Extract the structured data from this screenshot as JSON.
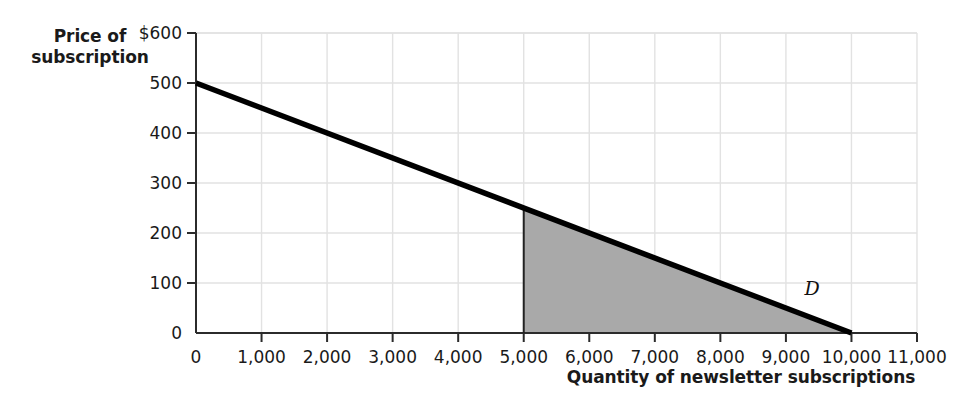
{
  "chart_data": {
    "type": "line",
    "title": "",
    "xlabel": "Quantity of newsletter subscriptions",
    "ylabel": "Price of subscription",
    "ylabel_line1": "Price of",
    "ylabel_line2": "subscription",
    "xlim": [
      0,
      11000
    ],
    "ylim": [
      0,
      600
    ],
    "grid": true,
    "legend": "none",
    "x_tick_labels": [
      "0",
      "1,000",
      "2,000",
      "3,000",
      "4,000",
      "5,000",
      "6,000",
      "7,000",
      "8,000",
      "9,000",
      "10,000",
      "11,000"
    ],
    "x_tick_values": [
      0,
      1000,
      2000,
      3000,
      4000,
      5000,
      6000,
      7000,
      8000,
      9000,
      10000,
      11000
    ],
    "y_tick_labels": [
      "0",
      "100",
      "200",
      "300",
      "400",
      "500",
      "$600"
    ],
    "y_tick_values": [
      0,
      100,
      200,
      300,
      400,
      500,
      600
    ],
    "series": [
      {
        "name": "D",
        "label": "D",
        "type": "line",
        "color": "#000000",
        "points": [
          {
            "x": 0,
            "y": 500
          },
          {
            "x": 10000,
            "y": 0
          }
        ]
      }
    ],
    "annotations": [
      {
        "name": "consumer-region-triangle",
        "type": "shaded-region",
        "color": "#a9a9a9",
        "vertices": [
          {
            "x": 5000,
            "y": 0
          },
          {
            "x": 5000,
            "y": 250
          },
          {
            "x": 10000,
            "y": 0
          }
        ]
      },
      {
        "name": "quantity-marker-line",
        "type": "vertical-line",
        "x": 5000,
        "y_from": 0,
        "y_to": 250,
        "color": "#222222"
      },
      {
        "name": "demand-curve-label",
        "type": "text",
        "text": "D",
        "x": 9400,
        "y": 90
      }
    ],
    "colors": {
      "line": "#000000",
      "shaded_region": "#a9a9a9",
      "gridline": "#e2e2e2",
      "axis": "#2b2b2b",
      "background": "#ffffff",
      "text": "#1a1a1a"
    }
  }
}
